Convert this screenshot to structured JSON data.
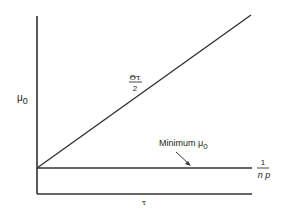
{
  "diagram": {
    "y_axis_label": "μ",
    "y_axis_label_sub": "0",
    "x_axis_label": "τ",
    "diagonal_label_numerator": "Θτ",
    "diagonal_label_denominator": "2",
    "minimum_label": "Minimum μ",
    "minimum_label_sub": "0",
    "baseline_label_numerator": "1",
    "baseline_label_denominator": "n p",
    "colors": {
      "line": "#333333",
      "text": "#222222",
      "background": "#ffffff"
    }
  }
}
